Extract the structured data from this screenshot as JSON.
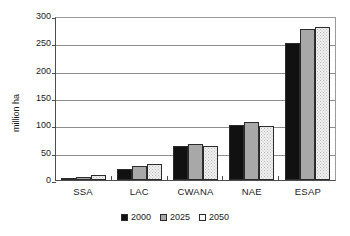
{
  "chart_data": {
    "type": "bar",
    "title": "",
    "subtitle": "",
    "xlabel": "",
    "ylabel": "million ha",
    "ylim": [
      0,
      300
    ],
    "ytick_step": 50,
    "yticks": [
      300,
      250,
      200,
      150,
      100,
      50,
      0
    ],
    "grid": true,
    "legend_position": "bottom-center",
    "categories": [
      "SSA",
      "LAC",
      "CWANA",
      "NAE",
      "ESAP"
    ],
    "series": [
      {
        "name": "2000",
        "color": "#111111",
        "values": [
          4,
          20,
          63,
          100,
          250
        ]
      },
      {
        "name": "2025",
        "color": "#a8a8a8",
        "values": [
          6,
          25,
          66,
          107,
          277
        ]
      },
      {
        "name": "2050",
        "color": "#f1f1f1",
        "values": [
          9,
          29,
          63,
          98,
          279
        ]
      }
    ]
  }
}
